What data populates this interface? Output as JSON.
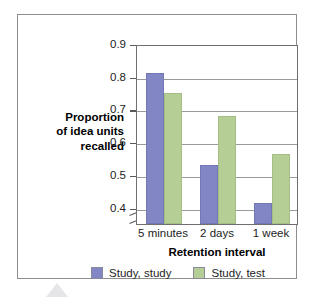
{
  "chart_data": {
    "type": "bar",
    "title": "",
    "subtitle": "",
    "categories": [
      "5 minutes",
      "2 days",
      "1 week"
    ],
    "series": [
      {
        "name": "Study, study",
        "color": "#8286c4",
        "values": [
          0.81,
          0.53,
          0.415
        ]
      },
      {
        "name": "Study, test",
        "color": "#b4ce95",
        "values": [
          0.75,
          0.68,
          0.565
        ]
      }
    ],
    "xlabel": "Retention interval",
    "ylabel": "Proportion of idea units recalled",
    "ylabel_lines": [
      "Proportion",
      "of idea units",
      "recalled"
    ],
    "ylim": [
      0.35,
      0.9
    ],
    "yticks": [
      0.9,
      0.8,
      0.7,
      0.6,
      0.5,
      0.4
    ],
    "ytick_labels": [
      "0.9",
      "0.8",
      "0.7",
      "0.6",
      "0.5",
      "0.4"
    ],
    "grid": true,
    "grid_axis": "y",
    "axis_break": true,
    "legend_position": "bottom",
    "frame": true
  },
  "colors": {
    "series_a": "#8286c4",
    "series_b": "#b4ce95",
    "gridline": "#9a9a9a",
    "axis": "#6f6f6f",
    "frame": "#8d8d8d",
    "text": "#1d1d1d"
  }
}
